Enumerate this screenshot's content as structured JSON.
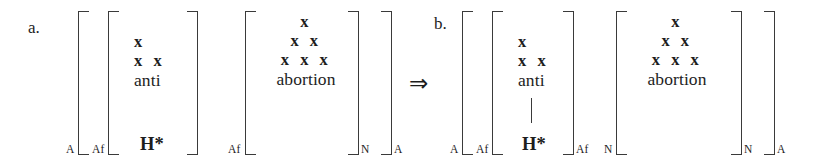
{
  "figure": {
    "kind": "linguistic-bracket-diagram",
    "symbols": {
      "implication_arrow": "⇒",
      "skeleton_slot": "x",
      "head_label": "H*"
    },
    "parts": [
      {
        "id": "a",
        "label": "a.",
        "brackets": [
          {
            "name": "outer-a-open",
            "side": "open",
            "subscript": "A"
          },
          {
            "name": "af-open",
            "side": "open",
            "subscript": "Af"
          },
          {
            "name": "af-close",
            "side": "close",
            "subscript": ""
          },
          {
            "name": "second-af-open",
            "side": "open",
            "subscript": "Af"
          },
          {
            "name": "noun-close",
            "side": "close",
            "subscript": "N"
          },
          {
            "name": "outer-a-close",
            "side": "close",
            "subscript": "A"
          }
        ],
        "affix_tree": {
          "name": "anti",
          "skeleton_rows": [
            "x",
            "x  x"
          ],
          "word": "anti",
          "head": "H*",
          "has_association_line": false
        },
        "stem_tree": {
          "name": "abortion",
          "skeleton_rows": [
            "x",
            "x  x",
            "x  x  x"
          ],
          "word": "abortion"
        }
      },
      {
        "id": "b",
        "label": "b.",
        "brackets": [
          {
            "name": "outer-a-open",
            "side": "open",
            "subscript": "A"
          },
          {
            "name": "af-open",
            "side": "open",
            "subscript": "Af"
          },
          {
            "name": "af-close",
            "side": "close",
            "subscript": "Af"
          },
          {
            "name": "noun-open",
            "side": "open",
            "subscript": "N"
          },
          {
            "name": "noun-close",
            "side": "close",
            "subscript": "N"
          },
          {
            "name": "outer-a-close",
            "side": "close",
            "subscript": "A"
          }
        ],
        "affix_tree": {
          "name": "anti",
          "skeleton_rows": [
            "x",
            "x  x"
          ],
          "word": "anti",
          "head": "H*",
          "has_association_line": true
        },
        "stem_tree": {
          "name": "abortion",
          "skeleton_rows": [
            "x",
            "x  x",
            "x  x  x"
          ],
          "word": "abortion"
        }
      }
    ]
  }
}
